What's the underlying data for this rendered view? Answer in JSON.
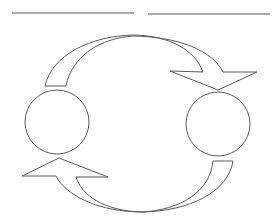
{
  "diagram": {
    "type": "cycle",
    "colors": {
      "stroke": "#5a5a5a",
      "fill": "#ffffff",
      "background": "#ffffff"
    },
    "blank_lines": [
      {
        "x1": 12,
        "y1": 13,
        "x2": 134,
        "y2": 13
      },
      {
        "x1": 148,
        "y1": 14,
        "x2": 270,
        "y2": 14
      }
    ],
    "nodes": [
      {
        "id": "left-circle",
        "cx": 57,
        "cy": 122,
        "r": 32,
        "label": ""
      },
      {
        "id": "right-circle",
        "cx": 218,
        "cy": 124,
        "r": 32,
        "label": ""
      }
    ],
    "arrows": [
      {
        "id": "top-arrow",
        "from": "left-circle",
        "to": "right-circle",
        "direction": "clockwise-over-top"
      },
      {
        "id": "bottom-arrow",
        "from": "right-circle",
        "to": "left-circle",
        "direction": "clockwise-under-bottom"
      }
    ]
  }
}
